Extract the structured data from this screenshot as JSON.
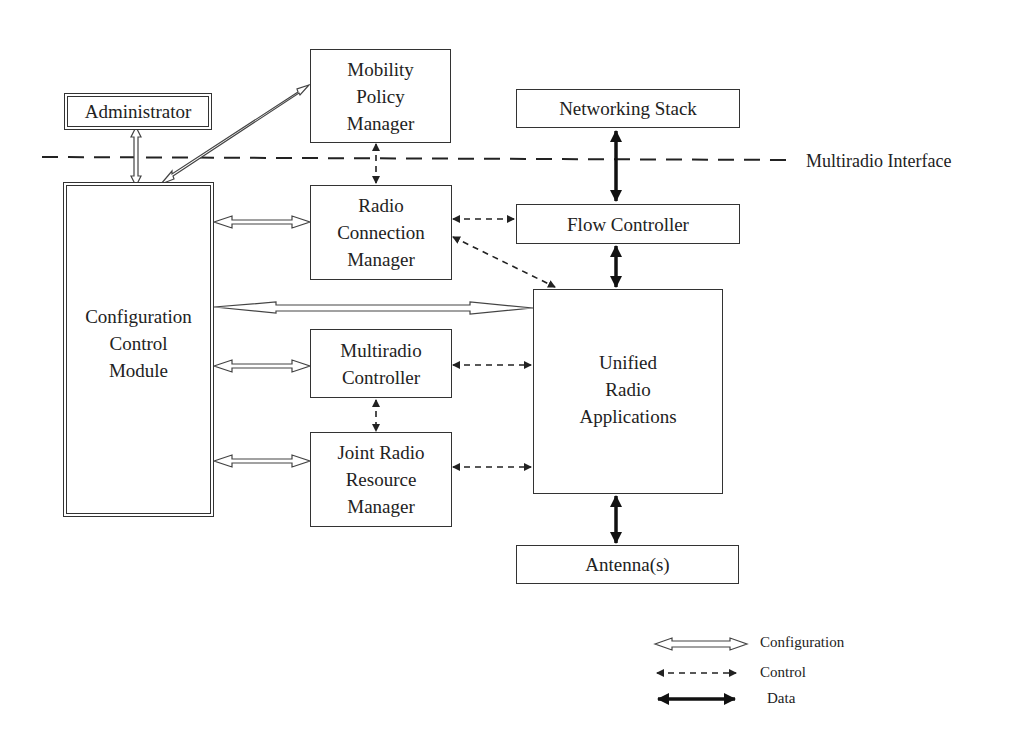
{
  "diagram": {
    "boundary_label": "Multiradio Interface",
    "nodes": {
      "administrator": {
        "label": "Administrator"
      },
      "mobility_policy_manager": {
        "label": "Mobility\nPolicy\nManager"
      },
      "networking_stack": {
        "label": "Networking Stack"
      },
      "configuration_control_module": {
        "label": "Configuration\nControl\nModule"
      },
      "radio_connection_manager": {
        "label": "Radio\nConnection\nManager"
      },
      "flow_controller": {
        "label": "Flow Controller"
      },
      "multiradio_controller": {
        "label": "Multiradio\nController"
      },
      "joint_radio_resource_manager": {
        "label": "Joint Radio\nResource\nManager"
      },
      "unified_radio_applications": {
        "label": "Unified\nRadio\nApplications"
      },
      "antennas": {
        "label": "Antenna(s)"
      }
    },
    "edges": [
      {
        "from": "administrator",
        "to": "configuration_control_module",
        "type": "configuration"
      },
      {
        "from": "configuration_control_module",
        "to": "mobility_policy_manager",
        "type": "configuration"
      },
      {
        "from": "configuration_control_module",
        "to": "radio_connection_manager",
        "type": "configuration"
      },
      {
        "from": "configuration_control_module",
        "to": "unified_radio_applications",
        "type": "configuration"
      },
      {
        "from": "configuration_control_module",
        "to": "multiradio_controller",
        "type": "configuration"
      },
      {
        "from": "configuration_control_module",
        "to": "joint_radio_resource_manager",
        "type": "configuration"
      },
      {
        "from": "mobility_policy_manager",
        "to": "radio_connection_manager",
        "type": "control"
      },
      {
        "from": "radio_connection_manager",
        "to": "flow_controller",
        "type": "control"
      },
      {
        "from": "radio_connection_manager",
        "to": "unified_radio_applications",
        "type": "control"
      },
      {
        "from": "multiradio_controller",
        "to": "unified_radio_applications",
        "type": "control"
      },
      {
        "from": "multiradio_controller",
        "to": "joint_radio_resource_manager",
        "type": "control"
      },
      {
        "from": "joint_radio_resource_manager",
        "to": "unified_radio_applications",
        "type": "control"
      },
      {
        "from": "networking_stack",
        "to": "flow_controller",
        "type": "data"
      },
      {
        "from": "flow_controller",
        "to": "unified_radio_applications",
        "type": "data"
      },
      {
        "from": "unified_radio_applications",
        "to": "antennas",
        "type": "data"
      }
    ],
    "legend": {
      "configuration": "Configuration",
      "control": "Control",
      "data": "Data"
    }
  }
}
